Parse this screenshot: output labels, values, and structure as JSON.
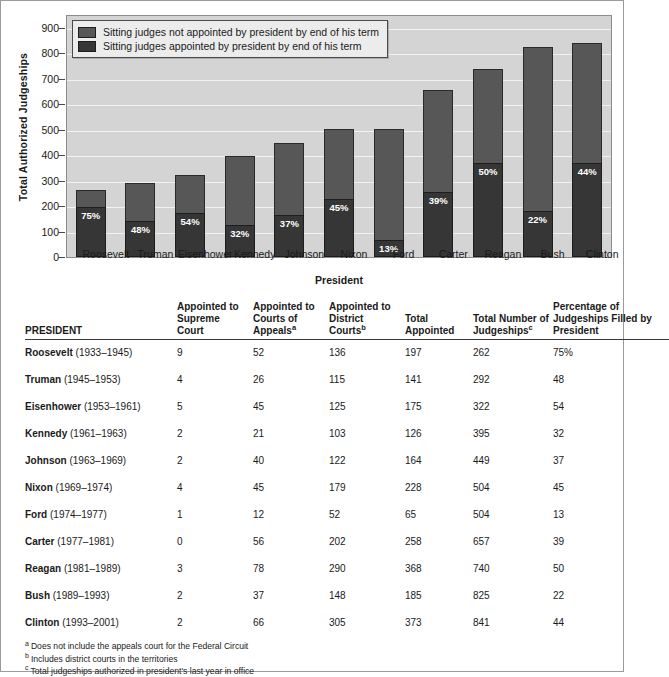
{
  "chart_data": {
    "type": "bar",
    "subtype": "stacked-bar",
    "title": "",
    "xlabel": "President",
    "ylabel": "Total Authorized Judgeships",
    "ylim": [
      0,
      950
    ],
    "yticks": [
      0,
      100,
      200,
      300,
      400,
      500,
      600,
      700,
      800,
      900
    ],
    "grid": true,
    "legend_position": "top-left",
    "categories": [
      "Roosevelt",
      "Truman",
      "Eisenhower",
      "Kennedy",
      "Johnson",
      "Nixon",
      "Ford",
      "Carter",
      "Reagan",
      "Bush",
      "Clinton"
    ],
    "series": [
      {
        "name": "Sitting judges appointed by president by end of his term",
        "color": "#363636",
        "values": [
          197,
          140,
          174,
          126,
          166,
          227,
          66,
          256,
          370,
          182,
          370
        ]
      },
      {
        "name": "Sitting judges not appointed by president by end of his term",
        "color": "#575757",
        "values": [
          65,
          152,
          148,
          269,
          283,
          277,
          438,
          401,
          370,
          643,
          471
        ]
      }
    ],
    "totals": [
      262,
      292,
      322,
      395,
      449,
      504,
      504,
      657,
      740,
      825,
      841
    ],
    "data_labels": [
      "75%",
      "48%",
      "54%",
      "32%",
      "37%",
      "45%",
      "13%",
      "39%",
      "50%",
      "22%",
      "44%"
    ]
  },
  "chart": {
    "y_axis_title": "Total Authorized Judgeships",
    "x_axis_title": "President",
    "y_tick_labels": [
      "900",
      "800",
      "700",
      "600",
      "500",
      "400",
      "300",
      "200",
      "100",
      "0"
    ],
    "legend": [
      {
        "label": "Sitting judges not appointed by president by end of his term",
        "color": "#575757"
      },
      {
        "label": "Sitting judges appointed by president by end of his term",
        "color": "#363636"
      }
    ],
    "bars": [
      {
        "name": "Roosevelt",
        "total": 262,
        "appointed": 197,
        "pct": "75%"
      },
      {
        "name": "Truman",
        "total": 292,
        "appointed": 140,
        "pct": "48%"
      },
      {
        "name": "Eisenhower",
        "total": 322,
        "appointed": 174,
        "pct": "54%"
      },
      {
        "name": "Kennedy",
        "total": 395,
        "appointed": 126,
        "pct": "32%"
      },
      {
        "name": "Johnson",
        "total": 449,
        "appointed": 166,
        "pct": "37%"
      },
      {
        "name": "Nixon",
        "total": 504,
        "appointed": 227,
        "pct": "45%"
      },
      {
        "name": "Ford",
        "total": 504,
        "appointed": 66,
        "pct": "13%"
      },
      {
        "name": "Carter",
        "total": 657,
        "appointed": 256,
        "pct": "39%"
      },
      {
        "name": "Reagan",
        "total": 740,
        "appointed": 370,
        "pct": "50%"
      },
      {
        "name": "Bush",
        "total": 825,
        "appointed": 182,
        "pct": "22%"
      },
      {
        "name": "Clinton",
        "total": 841,
        "appointed": 370,
        "pct": "44%"
      }
    ]
  },
  "table": {
    "headers": {
      "president": "PRESIDENT",
      "supreme": "Appointed to Supreme Court",
      "appeals": "Appointed to Courts of Appeals",
      "appeals_fn": "a",
      "district": "Appointed to District Courts",
      "district_fn": "b",
      "total_appointed": "Total Appointed",
      "total_number": "Total Number of Judgeships",
      "total_number_fn": "c",
      "percentage": "Percentage of Judgeships Filled by President"
    },
    "rows": [
      {
        "name": "Roosevelt",
        "years": "(1933–1945)",
        "supreme": "9",
        "appeals": "52",
        "district": "136",
        "total_appointed": "197",
        "total_number": "262",
        "percentage": "75%"
      },
      {
        "name": "Truman",
        "years": "(1945–1953)",
        "supreme": "4",
        "appeals": "26",
        "district": "115",
        "total_appointed": "141",
        "total_number": "292",
        "percentage": "48"
      },
      {
        "name": "Eisenhower",
        "years": "(1953–1961)",
        "supreme": "5",
        "appeals": "45",
        "district": "125",
        "total_appointed": "175",
        "total_number": "322",
        "percentage": "54"
      },
      {
        "name": "Kennedy",
        "years": "(1961–1963)",
        "supreme": "2",
        "appeals": "21",
        "district": "103",
        "total_appointed": "126",
        "total_number": "395",
        "percentage": "32"
      },
      {
        "name": "Johnson",
        "years": "(1963–1969)",
        "supreme": "2",
        "appeals": "40",
        "district": "122",
        "total_appointed": "164",
        "total_number": "449",
        "percentage": "37"
      },
      {
        "name": "Nixon",
        "years": "(1969–1974)",
        "supreme": "4",
        "appeals": "45",
        "district": "179",
        "total_appointed": "228",
        "total_number": "504",
        "percentage": "45"
      },
      {
        "name": "Ford",
        "years": "(1974–1977)",
        "supreme": "1",
        "appeals": "12",
        "district": "52",
        "total_appointed": "65",
        "total_number": "504",
        "percentage": "13"
      },
      {
        "name": "Carter",
        "years": "(1977–1981)",
        "supreme": "0",
        "appeals": "56",
        "district": "202",
        "total_appointed": "258",
        "total_number": "657",
        "percentage": "39"
      },
      {
        "name": "Reagan",
        "years": "(1981–1989)",
        "supreme": "3",
        "appeals": "78",
        "district": "290",
        "total_appointed": "368",
        "total_number": "740",
        "percentage": "50"
      },
      {
        "name": "Bush",
        "years": "(1989–1993)",
        "supreme": "2",
        "appeals": "37",
        "district": "148",
        "total_appointed": "185",
        "total_number": "825",
        "percentage": "22"
      },
      {
        "name": "Clinton",
        "years": "(1993–2001)",
        "supreme": "2",
        "appeals": "66",
        "district": "305",
        "total_appointed": "373",
        "total_number": "841",
        "percentage": "44"
      }
    ],
    "footnotes": [
      {
        "marker": "a",
        "text": "Does not include the appeals court for the Federal Circuit"
      },
      {
        "marker": "b",
        "text": "Includes district courts in the territories"
      },
      {
        "marker": "c",
        "text": "Total judgeships authorized in president's last year in office"
      }
    ]
  }
}
